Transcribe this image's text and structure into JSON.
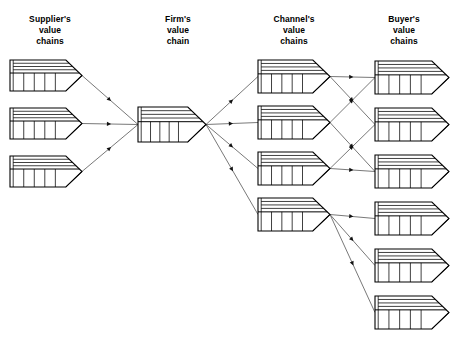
{
  "figure": {
    "background_color": "#ffffff",
    "line_color": "#000000",
    "arrow_color": "#555555"
  },
  "columns": [
    {
      "id": "suppliers",
      "label": "Supplier's\nvalue\nchains",
      "count": 3,
      "label_x": 12,
      "label_y": 14
    },
    {
      "id": "firm",
      "label": "Firm's\nvalue\nchain",
      "count": 1,
      "label_x": 142,
      "label_y": 14
    },
    {
      "id": "channels",
      "label": "Channel's\nvalue\nchains",
      "count": 4,
      "label_x": 252,
      "label_y": 14
    },
    {
      "id": "buyers",
      "label": "Buyer's\nvalue\nchains",
      "count": 6,
      "label_x": 362,
      "label_y": 14
    }
  ],
  "chart_data": {
    "type": "diagram",
    "shape": "value-chain-arrow",
    "shape_detail": {
      "support_bands": 4,
      "primary_cells": 5,
      "left_margin_column": true,
      "arrow_tip_on_right": true
    },
    "nodes": [
      {
        "id": "sup1",
        "group": "suppliers",
        "index": 1,
        "x": 10,
        "y": 60,
        "w": 72,
        "h": 31
      },
      {
        "id": "sup2",
        "group": "suppliers",
        "index": 2,
        "x": 10,
        "y": 108,
        "w": 72,
        "h": 31
      },
      {
        "id": "sup3",
        "group": "suppliers",
        "index": 3,
        "x": 10,
        "y": 156,
        "w": 72,
        "h": 31
      },
      {
        "id": "firm1",
        "group": "firm",
        "index": 1,
        "x": 138,
        "y": 107,
        "w": 68,
        "h": 35
      },
      {
        "id": "ch1",
        "group": "channels",
        "index": 1,
        "x": 258,
        "y": 60,
        "w": 72,
        "h": 33
      },
      {
        "id": "ch2",
        "group": "channels",
        "index": 2,
        "x": 258,
        "y": 106,
        "w": 72,
        "h": 33
      },
      {
        "id": "ch3",
        "group": "channels",
        "index": 3,
        "x": 258,
        "y": 152,
        "w": 72,
        "h": 33
      },
      {
        "id": "ch4",
        "group": "channels",
        "index": 4,
        "x": 258,
        "y": 198,
        "w": 72,
        "h": 33
      },
      {
        "id": "buy1",
        "group": "buyers",
        "index": 1,
        "x": 375,
        "y": 61,
        "w": 74,
        "h": 33
      },
      {
        "id": "buy2",
        "group": "buyers",
        "index": 2,
        "x": 375,
        "y": 108,
        "w": 74,
        "h": 33
      },
      {
        "id": "buy3",
        "group": "buyers",
        "index": 3,
        "x": 375,
        "y": 155,
        "w": 74,
        "h": 33
      },
      {
        "id": "buy4",
        "group": "buyers",
        "index": 4,
        "x": 375,
        "y": 202,
        "w": 74,
        "h": 33
      },
      {
        "id": "buy5",
        "group": "buyers",
        "index": 5,
        "x": 375,
        "y": 249,
        "w": 74,
        "h": 33
      },
      {
        "id": "buy6",
        "group": "buyers",
        "index": 6,
        "x": 375,
        "y": 296,
        "w": 74,
        "h": 33
      }
    ],
    "edges": [
      {
        "from": "sup1",
        "to": "firm1"
      },
      {
        "from": "sup2",
        "to": "firm1"
      },
      {
        "from": "sup3",
        "to": "firm1"
      },
      {
        "from": "firm1",
        "to": "ch1"
      },
      {
        "from": "firm1",
        "to": "ch2"
      },
      {
        "from": "firm1",
        "to": "ch3"
      },
      {
        "from": "firm1",
        "to": "ch4"
      },
      {
        "from": "ch1",
        "to": "buy1"
      },
      {
        "from": "ch1",
        "to": "buy2"
      },
      {
        "from": "ch2",
        "to": "buy1"
      },
      {
        "from": "ch2",
        "to": "buy3"
      },
      {
        "from": "ch3",
        "to": "buy2"
      },
      {
        "from": "ch3",
        "to": "buy3"
      },
      {
        "from": "ch4",
        "to": "buy4"
      },
      {
        "from": "ch4",
        "to": "buy5"
      },
      {
        "from": "ch4",
        "to": "buy6"
      }
    ]
  }
}
